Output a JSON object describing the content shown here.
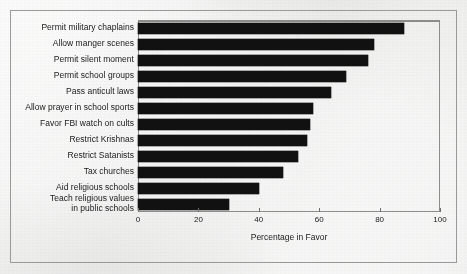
{
  "figure": {
    "background_color": "#ececeb",
    "frame_color": "#9a9a99",
    "bar_color": "#111111"
  },
  "chart_data": {
    "type": "bar",
    "orientation": "horizontal",
    "title": "",
    "subtitle": "",
    "xlabel": "Percentage in Favor",
    "ylabel": "",
    "xlim": [
      0,
      100
    ],
    "xticks": [
      0,
      20,
      40,
      60,
      80,
      100
    ],
    "xtick_labels": [
      "0",
      "20",
      "40",
      "60",
      "80",
      "100"
    ],
    "grid": false,
    "legend": null,
    "legend_position": "none",
    "categories": [
      "Permit military chaplains",
      "Allow manger scenes",
      "Permit silent moment",
      "Permit school groups",
      "Pass anticult laws",
      "Allow prayer in school sports",
      "Favor FBI watch on cults",
      "Restrict Krishnas",
      "Restrict Satanists",
      "Tax churches",
      "Aid religious schools",
      "Teach religious values\nin public schools"
    ],
    "values": [
      88,
      78,
      76,
      69,
      64,
      58,
      57,
      56,
      53,
      48,
      40,
      30
    ],
    "series": [
      {
        "name": "Percentage in Favor",
        "values": [
          88,
          78,
          76,
          69,
          64,
          58,
          57,
          56,
          53,
          48,
          40,
          30
        ]
      }
    ]
  }
}
